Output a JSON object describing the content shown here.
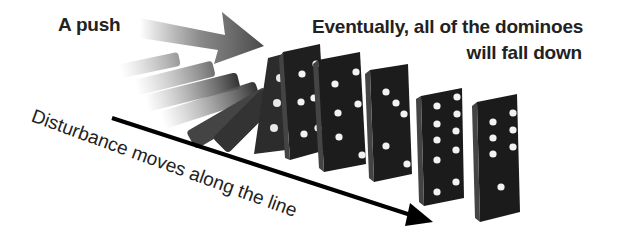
{
  "labels": {
    "push": "A push",
    "result_line1": "Eventually, all of the dominoes",
    "result_line2": "will fall down",
    "disturbance": "Disturbance moves along the line"
  },
  "colors": {
    "text": "#222222",
    "domino_face": "#1e1e1e",
    "domino_side": "#3a3a3a",
    "pip": "#f2f2f2",
    "push_arrow": "#5a5a5a",
    "line_arrow": "#000000"
  },
  "dominoes": [
    {
      "state": "fallen",
      "count": 4
    },
    {
      "state": "falling",
      "count": 2
    },
    {
      "state": "standing",
      "pips_top": 2,
      "pips_bottom": 4
    },
    {
      "state": "standing",
      "pips_top": 3,
      "pips_bottom": 3
    },
    {
      "state": "standing",
      "pips_top": 3,
      "pips_bottom": 2
    },
    {
      "state": "standing",
      "pips_top": 6,
      "pips_bottom": 4
    },
    {
      "state": "standing",
      "pips_top": 6,
      "pips_bottom": 1
    }
  ]
}
